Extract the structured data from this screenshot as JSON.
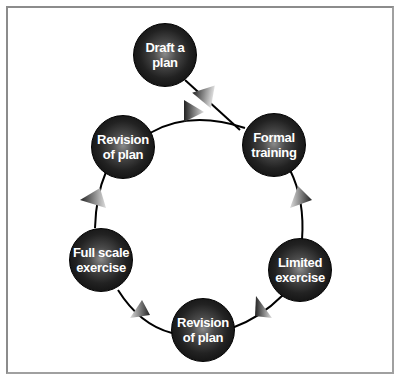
{
  "diagram": {
    "type": "cycle",
    "nodes": [
      {
        "id": "draft",
        "label_line1": "Draft a",
        "label_line2": "plan"
      },
      {
        "id": "formal",
        "label_line1": "Formal",
        "label_line2": "training"
      },
      {
        "id": "limited",
        "label_line1": "Limited",
        "label_line2": "exercise"
      },
      {
        "id": "revision2",
        "label_line1": "Revision",
        "label_line2": "of plan"
      },
      {
        "id": "fullscale",
        "label_line1": "Full scale",
        "label_line2": "exercise"
      },
      {
        "id": "revision1",
        "label_line1": "Revision",
        "label_line2": "of plan"
      }
    ],
    "edges": [
      {
        "from": "draft",
        "to": "formal"
      },
      {
        "from": "formal",
        "to": "limited"
      },
      {
        "from": "limited",
        "to": "revision2"
      },
      {
        "from": "revision2",
        "to": "fullscale"
      },
      {
        "from": "fullscale",
        "to": "revision1"
      },
      {
        "from": "revision1",
        "to": "formal"
      }
    ],
    "colors": {
      "node": "#111111",
      "text": "#ffffff",
      "line": "#000000",
      "frame": "#a0a0a0"
    }
  }
}
